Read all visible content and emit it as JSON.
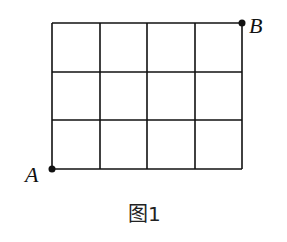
{
  "figure": {
    "caption": "图1",
    "grid": {
      "cols": 4,
      "rows": 3
    },
    "points": {
      "A": {
        "label": "A",
        "position": "bottom-left corner"
      },
      "B": {
        "label": "B",
        "position": "top-right corner"
      }
    },
    "line_color": "#111111"
  }
}
